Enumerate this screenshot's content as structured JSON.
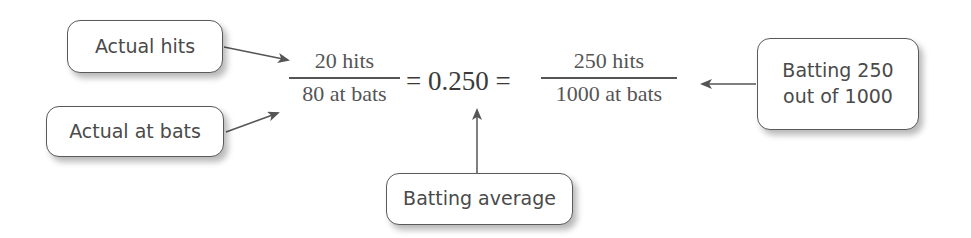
{
  "callouts": {
    "actual_hits": "Actual hits",
    "actual_at_bats": "Actual at bats",
    "batting_line1": "Batting 250",
    "batting_line2": "out of 1000",
    "batting_average": "Batting average"
  },
  "equation": {
    "left_fraction": {
      "numerator": "20 hits",
      "denominator": "80 at bats"
    },
    "middle": "= 0.250 =",
    "right_fraction": {
      "numerator": "250 hits",
      "denominator": "1000 at bats"
    }
  },
  "colors": {
    "text": "#4a4a4a",
    "border": "#5a5a5a",
    "arrow": "#555555"
  }
}
